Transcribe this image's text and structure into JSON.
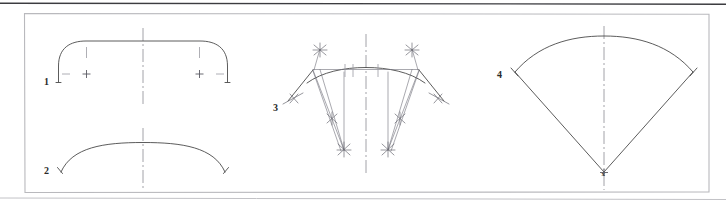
{
  "page": {
    "background_color": "#ffffff",
    "width": 726,
    "height": 207
  },
  "frame": {
    "top_rule_color": "#3c3c40",
    "border_color": "#b9b9bd",
    "bottom_rule_color": "#c2c2c6",
    "left": 24,
    "top": 13,
    "right": 709,
    "bottom": 192
  },
  "colors": {
    "outline": "#4a4a4a",
    "construction": "#6e6e78",
    "centerline": "#8a8a92",
    "tick": "#9a9aa2",
    "label": "#2a2a2a"
  },
  "figures": [
    {
      "id": "figure-1",
      "label": "1",
      "label_x": 47,
      "label_y": 82,
      "description": "arch with rounded corners, tangent ticks and center-point plus marks",
      "centerline_x": 143
    },
    {
      "id": "figure-2",
      "label": "2",
      "label_x": 47,
      "label_y": 171,
      "description": "shallow segmental arc spanning the same width",
      "centerline_x": 143
    },
    {
      "id": "figure-3",
      "label": "3",
      "label_x": 276,
      "label_y": 108,
      "description": "arc construction with radial lines, bisector crosses and intersection x marks",
      "centerline_x": 366
    },
    {
      "id": "figure-4",
      "label": "4",
      "label_x": 501,
      "label_y": 75,
      "description": "circular sector fan with apex at center point",
      "centerline_x": 604,
      "apex_label": "x",
      "apex_x": 604,
      "apex_y": 173
    }
  ]
}
